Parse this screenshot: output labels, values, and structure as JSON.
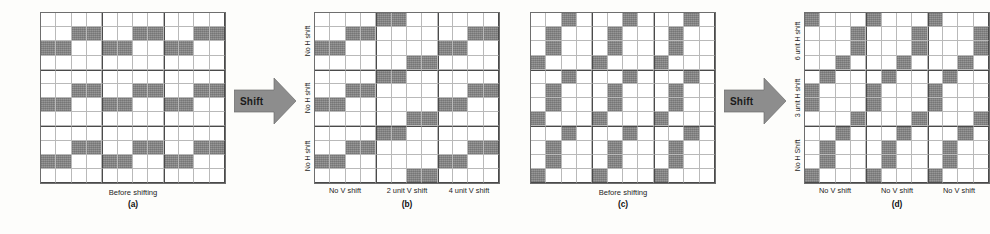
{
  "figure": {
    "panels": [
      {
        "id": "a",
        "letter": "(a)",
        "caption": "Before shifting",
        "show_axis_labels": false,
        "row_labels": [],
        "col_labels": [],
        "base_pattern": [
          [
            0,
            0,
            0,
            0
          ],
          [
            0,
            0,
            1,
            1
          ],
          [
            1,
            1,
            0,
            0
          ],
          [
            0,
            0,
            0,
            0
          ]
        ],
        "row_block_h_shift": [
          0,
          0,
          0
        ],
        "col_block_v_shift": [
          0,
          0,
          0
        ]
      },
      {
        "id": "b",
        "letter": "(b)",
        "caption": "",
        "show_axis_labels": true,
        "row_labels": [
          "No H shift",
          "No H shift",
          "No H shift"
        ],
        "col_labels": [
          "No V shift",
          "2 unit V shift",
          "4 unit V shift"
        ],
        "base_pattern": [
          [
            0,
            0,
            0,
            0
          ],
          [
            0,
            0,
            1,
            1
          ],
          [
            1,
            1,
            0,
            0
          ],
          [
            0,
            0,
            0,
            0
          ]
        ],
        "row_block_h_shift": [
          0,
          0,
          0
        ],
        "col_block_v_shift": [
          0,
          2,
          4
        ]
      },
      {
        "id": "c",
        "letter": "(c)",
        "caption": "Before shifting",
        "show_axis_labels": false,
        "row_labels": [],
        "col_labels": [],
        "base_pattern": [
          [
            0,
            0,
            1,
            0
          ],
          [
            0,
            1,
            0,
            0
          ],
          [
            0,
            1,
            0,
            0
          ],
          [
            1,
            0,
            0,
            0
          ]
        ],
        "row_block_h_shift": [
          0,
          0,
          0
        ],
        "col_block_v_shift": [
          0,
          0,
          0
        ]
      },
      {
        "id": "d",
        "letter": "(d)",
        "caption": "",
        "show_axis_labels": true,
        "row_labels": [
          "6 unit H shift",
          "3 unit H shift",
          "No H Shift"
        ],
        "col_labels": [
          "No V shift",
          "No V shift",
          "No V shift"
        ],
        "base_pattern": [
          [
            0,
            0,
            1,
            0
          ],
          [
            0,
            1,
            0,
            0
          ],
          [
            0,
            1,
            0,
            0
          ],
          [
            1,
            0,
            0,
            0
          ]
        ],
        "row_block_h_shift": [
          6,
          3,
          0
        ],
        "col_block_v_shift": [
          0,
          0,
          0
        ]
      }
    ],
    "arrows": [
      {
        "label": "Shift"
      },
      {
        "label": "Shift"
      }
    ],
    "grid": {
      "size": 12,
      "block_size": 4,
      "cell_on_color": "#8d8d8d",
      "cell_off_color": "#ffffff",
      "thick_line_color": "#4a4a4a",
      "thin_line_color": "#b9b9b9"
    }
  }
}
